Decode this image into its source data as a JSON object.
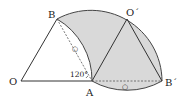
{
  "diagram": {
    "type": "geometry-rotation",
    "points": {
      "O": {
        "label": "O",
        "x": 21,
        "y": 81
      },
      "A": {
        "label": "A",
        "x": 92,
        "y": 81
      },
      "B": {
        "label": "B",
        "x": 57,
        "y": 19
      },
      "O_prime": {
        "label": "O´",
        "x": 127,
        "y": 19
      },
      "B_prime": {
        "label": "B´",
        "x": 162,
        "y": 81
      }
    },
    "angle_label": "120°",
    "mark_labels": {
      "mark_BA": "○",
      "mark_AB_prime": "○"
    },
    "colors": {
      "shade": "#d9d9d9",
      "line": "#333333",
      "dashed": "#555555"
    }
  }
}
